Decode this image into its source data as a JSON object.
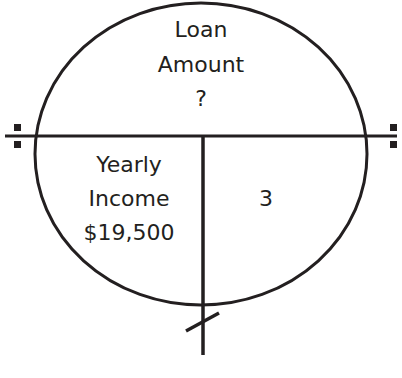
{
  "diagram": {
    "type": "formula-circle",
    "top_section": {
      "line1": "Loan",
      "line2": "Amount",
      "line3": "?"
    },
    "bottom_left_section": {
      "line1": "Yearly",
      "line2": "Income",
      "line3": "$19,500"
    },
    "bottom_right_section": {
      "value": "3"
    },
    "symbols": {
      "left": "division-sign",
      "right": "division-sign",
      "bottom": "slash-mark"
    },
    "colors": {
      "stroke": "#231f20",
      "text": "#231f20",
      "background": "#ffffff"
    }
  }
}
